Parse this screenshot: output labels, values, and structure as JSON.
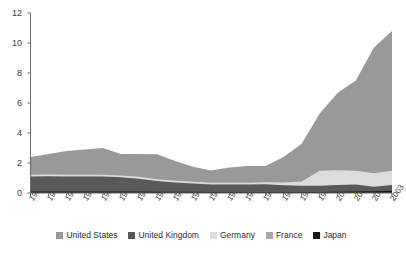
{
  "chart_data": {
    "type": "area",
    "stacked": true,
    "title": "",
    "xlabel": "",
    "ylabel": "",
    "ylim": [
      0,
      12
    ],
    "yticks": [
      0,
      2,
      4,
      6,
      8,
      10,
      12
    ],
    "grid": false,
    "legend_position": "bottom",
    "categories": [
      "1983",
      "1984",
      "1985",
      "1986",
      "1987",
      "1988",
      "1989",
      "1990",
      "1991",
      "1992",
      "1993",
      "1994",
      "1995",
      "1996",
      "1997",
      "1998",
      "1999",
      "2000",
      "2001",
      "2002",
      "2003"
    ],
    "series": [
      {
        "name": "Japan",
        "color": "#1a1a1a",
        "values": [
          0.1,
          0.1,
          0.1,
          0.1,
          0.1,
          0.1,
          0.1,
          0.08,
          0.08,
          0.08,
          0.07,
          0.07,
          0.07,
          0.07,
          0.07,
          0.07,
          0.07,
          0.08,
          0.1,
          0.12,
          0.15
        ]
      },
      {
        "name": "United Kingdom",
        "color": "#595959",
        "values": [
          1.0,
          1.02,
          1.0,
          1.0,
          1.0,
          0.95,
          0.85,
          0.72,
          0.62,
          0.55,
          0.5,
          0.5,
          0.5,
          0.52,
          0.45,
          0.42,
          0.42,
          0.45,
          0.47,
          0.3,
          0.38
        ]
      },
      {
        "name": "Germany",
        "color": "#dcdcdc",
        "values": [
          0.12,
          0.12,
          0.12,
          0.12,
          0.12,
          0.12,
          0.14,
          0.12,
          0.12,
          0.12,
          0.12,
          0.12,
          0.12,
          0.12,
          0.18,
          0.28,
          1.0,
          0.98,
          0.92,
          0.9,
          0.95
        ]
      },
      {
        "name": "France",
        "color": "#999999",
        "values": [
          0.0,
          0.0,
          0.0,
          0.0,
          0.0,
          0.0,
          0.0,
          0.0,
          0.0,
          0.0,
          0.0,
          0.0,
          0.0,
          0.0,
          0.0,
          0.0,
          0.0,
          0.0,
          0.0,
          0.0,
          0.0
        ]
      },
      {
        "name": "United States",
        "color": "#999999",
        "values": [
          1.18,
          1.36,
          1.58,
          1.68,
          1.78,
          1.43,
          1.51,
          1.66,
          1.31,
          1.0,
          0.81,
          1.01,
          1.11,
          1.09,
          1.7,
          2.51,
          3.81,
          5.17,
          6.01,
          8.38,
          9.32
        ]
      }
    ],
    "totals": [
      2.4,
      2.6,
      2.8,
      2.9,
      3.0,
      2.6,
      2.6,
      2.58,
      2.13,
      1.75,
      1.5,
      1.7,
      1.8,
      1.8,
      2.4,
      3.28,
      5.3,
      6.68,
      7.5,
      9.7,
      10.8
    ]
  },
  "legend": {
    "items": [
      {
        "label": "United States",
        "color": "#999999",
        "key": "united-states"
      },
      {
        "label": "United Kingdom",
        "color": "#595959",
        "key": "united-kingdom"
      },
      {
        "label": "Germany",
        "color": "#dcdcdc",
        "key": "germany"
      },
      {
        "label": "France",
        "color": "#a8a8a8",
        "key": "france"
      },
      {
        "label": "Japan",
        "color": "#1a1a1a",
        "key": "japan"
      }
    ]
  },
  "axes": {
    "y_labels": [
      "12",
      "10",
      "8",
      "6",
      "4",
      "2",
      "0"
    ],
    "x_labels": [
      "1983",
      "1984",
      "1985",
      "1986",
      "1987",
      "1988",
      "1989",
      "1990",
      "1991",
      "1992",
      "1993",
      "1994",
      "1995",
      "1996",
      "1997",
      "1998",
      "1999",
      "2000",
      "2001",
      "2002",
      "2003"
    ],
    "axis_color": "#6b6b6b"
  }
}
